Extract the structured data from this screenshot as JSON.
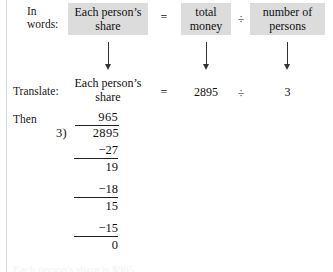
{
  "figure": {
    "type": "worked-example-long-division",
    "background_color": "#ffffff",
    "box_fill_color": "#dcdcdc",
    "text_color": "#1a1a1a"
  },
  "rows": {
    "in_words_label": "In\nwords:",
    "translate_label": "Translate:",
    "then_label": "Then"
  },
  "word_equation": {
    "share_box": "Each person’s\nshare",
    "equals": "=",
    "money_box": "total\nmoney",
    "divide": "÷",
    "persons_box": "number of\npersons"
  },
  "translated_equation": {
    "share": "Each person’s\nshare",
    "equals": "=",
    "total_money": "2895",
    "divide": "÷",
    "number_of_persons": "3"
  },
  "arrows": {
    "share_arrow": "down-arrow",
    "money_arrow": "down-arrow",
    "persons_arrow": "down-arrow"
  },
  "long_division": {
    "quotient": "965",
    "divisor": "3)",
    "dividend": "2895",
    "steps": [
      {
        "subtract": "−27",
        "remainder": "19"
      },
      {
        "subtract": "−18",
        "remainder": "15"
      },
      {
        "subtract": "−15",
        "remainder": "0"
      }
    ]
  },
  "caption_cut_off": "Each person's share is $965."
}
